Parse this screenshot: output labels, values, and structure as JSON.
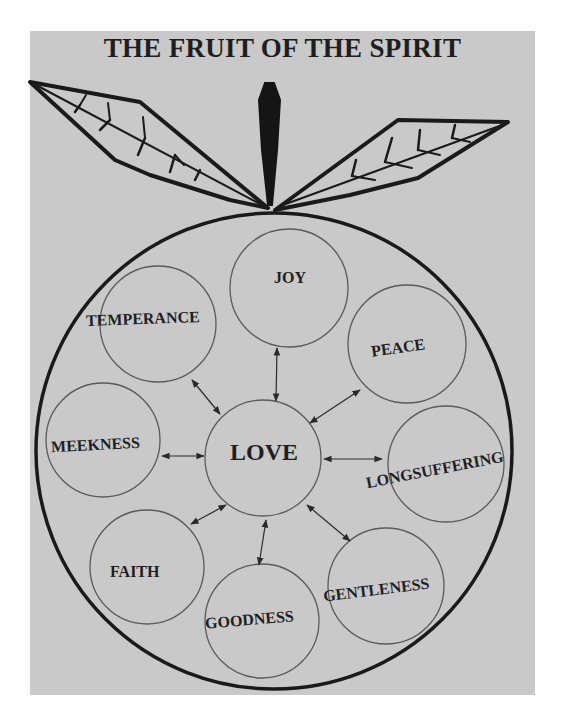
{
  "title": "THE FRUIT OF THE SPIRIT",
  "colors": {
    "background": "#c9c9c9",
    "outline": "#1a1a1a",
    "circle_stroke": "#555555",
    "text": "#1f1f1f"
  },
  "diagram": {
    "type": "hub-and-spoke",
    "shape": "fruit with stem and two leaves",
    "center": {
      "label": "LOVE"
    },
    "nodes": [
      {
        "label": "JOY",
        "position": "top"
      },
      {
        "label": "PEACE",
        "position": "upper-right"
      },
      {
        "label": "LONGSUFFERING",
        "position": "right"
      },
      {
        "label": "GENTLENESS",
        "position": "lower-right"
      },
      {
        "label": "GOODNESS",
        "position": "bottom"
      },
      {
        "label": "FAITH",
        "position": "lower-left"
      },
      {
        "label": "MEEKNESS",
        "position": "left"
      },
      {
        "label": "TEMPERANCE",
        "position": "upper-left"
      }
    ],
    "edges": "bidirectional arrows between LOVE and each surrounding node"
  }
}
